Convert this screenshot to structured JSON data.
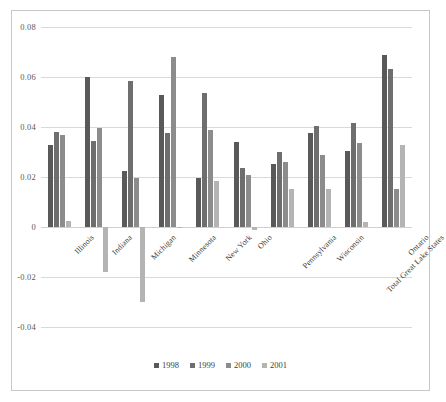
{
  "chart_data": {
    "type": "bar",
    "title": "",
    "xlabel": "",
    "ylabel": "",
    "ylim": [
      -0.04,
      0.08
    ],
    "ytick_labels": [
      "0.08",
      "0.06",
      "0.04",
      "0.02",
      "0",
      "-0.02",
      "-0.04"
    ],
    "ytick_values": [
      0.08,
      0.06,
      0.04,
      0.02,
      0,
      -0.02,
      -0.04
    ],
    "grid": true,
    "legend_position": "bottom",
    "categories": [
      "Illinois",
      "Indiana",
      "Michigan",
      "Minnesota",
      "New York",
      "Ohio",
      "Pennsylvania",
      "Wisconsin",
      "Total Great Lake States",
      "Ontario"
    ],
    "series": [
      {
        "name": "1998",
        "color": "#595959",
        "values": [
          0.033,
          0.0602,
          0.0225,
          0.0528,
          0.0195,
          0.034,
          0.0253,
          0.0375,
          0.0305,
          0.069
        ]
      },
      {
        "name": "1999",
        "color": "#6E6E6E",
        "values": [
          0.038,
          0.0345,
          0.0585,
          0.0378,
          0.0535,
          0.0235,
          0.03,
          0.0405,
          0.0415,
          0.0632
        ]
      },
      {
        "name": "2000",
        "color": "#8C8C8C",
        "values": [
          0.0367,
          0.0397,
          0.0197,
          0.068,
          0.0387,
          0.021,
          0.026,
          0.029,
          0.0335,
          0.0152
        ]
      },
      {
        "name": "2001",
        "color": "#B4B4B4",
        "values": [
          0.0023,
          -0.0178,
          -0.03,
          -0.0005,
          0.0185,
          -0.001,
          0.0153,
          0.0153,
          0.002,
          0.033
        ]
      }
    ]
  },
  "legend": {
    "items": [
      {
        "label": "1998",
        "color": "#595959"
      },
      {
        "label": "1999",
        "color": "#6E6E6E"
      },
      {
        "label": "2000",
        "color": "#8C8C8C"
      },
      {
        "label": "2001",
        "color": "#B4B4B4"
      }
    ]
  }
}
